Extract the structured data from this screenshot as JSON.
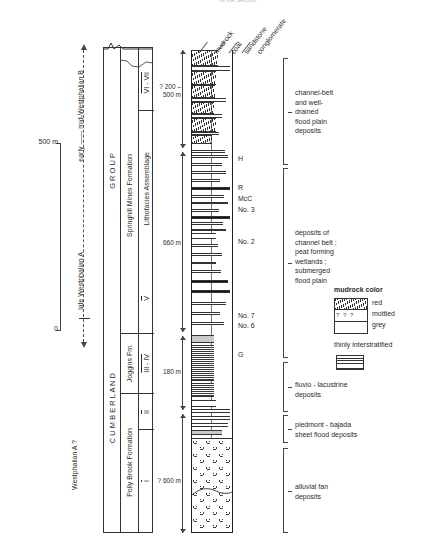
{
  "figure": {
    "scale_top_label": "500 m",
    "scale_bottom_label": "0",
    "cut_title": "of the Section"
  },
  "time_axis": {
    "upper_label": "early —— mid-Westphalian B",
    "lower_label": "late Westphalian A",
    "bottom_label": "Westphalian A  ?"
  },
  "stratigraphy": {
    "group": "G   R   O   U   P",
    "group_lower": "C   U   M   B   E   R   L   A   N   D",
    "formations": [
      {
        "name": "Springhill  Mines   Formation"
      },
      {
        "name": "Joggins Fm."
      },
      {
        "name": "Polly Brook Formation"
      }
    ],
    "assemblage_header": "Lithofacies  Assemblage",
    "assemblages": [
      "VI - VII",
      "V",
      "III - IV",
      "II",
      "I"
    ]
  },
  "column_headers": [
    "mudrock",
    "coal",
    "sandstone",
    "conglomerate"
  ],
  "thickness_labels": [
    {
      "text": "? 200 –\n500 m"
    },
    {
      "text": "660 m"
    },
    {
      "text": "180 m"
    },
    {
      "text": "? 600 m"
    }
  ],
  "coal_seams": [
    "H",
    "R",
    "McC",
    "No. 3",
    "No. 2",
    "No. 7",
    "No. 6",
    "G"
  ],
  "interpretations": [
    "channel-belt\nand  well-\ndrained\nflood plain\ndeposits",
    "deposits of\nchannel  belt ;\npeat forming\nwetlands ;\nsubmerged\nflood plain",
    "fluvio - lacustrine\ndeposits",
    "piedmont - bajada\nsheet flood deposits",
    "alluvial fan\ndeposits"
  ],
  "legend": {
    "title": "mudrock color",
    "entries": [
      "red",
      "mottled",
      "grey"
    ],
    "thin_label": "thinly interstratified"
  },
  "colors": {
    "ink": "#2a2a2a",
    "line": "#333333",
    "coal": "#141414",
    "grey_mudrock": "#c9c9c9"
  }
}
